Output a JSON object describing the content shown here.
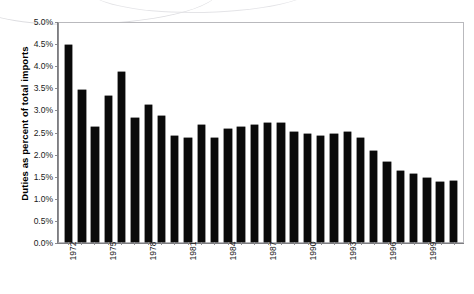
{
  "chart_data": {
    "type": "bar",
    "title": "",
    "xlabel": "",
    "ylabel": "Duties as percent of total imports",
    "ylim": [
      0.0,
      5.0
    ],
    "ytick_labels": [
      "0.0%",
      "0.5%",
      "1.0%",
      "1.5%",
      "2.0%",
      "2.5%",
      "3.0%",
      "3.5%",
      "4.0%",
      "4.5%",
      "5.0%"
    ],
    "ytick_values": [
      0.0,
      0.5,
      1.0,
      1.5,
      2.0,
      2.5,
      3.0,
      3.5,
      4.0,
      4.5,
      5.0
    ],
    "grid": false,
    "legend": false,
    "bar_color": "#0a0a0a",
    "plot_border_color": "#b9b9bd",
    "axis_color": "#7d7d81",
    "categories": [
      "1972",
      "1973",
      "1974",
      "1975",
      "1976",
      "1977",
      "1978",
      "1979",
      "1980",
      "1981",
      "1982",
      "1983",
      "1984",
      "1985",
      "1986",
      "1987",
      "1988",
      "1989",
      "1990",
      "1991",
      "1992",
      "1993",
      "1994",
      "1995",
      "1996",
      "1997",
      "1998",
      "1999",
      "2000",
      "2001"
    ],
    "xtick_labels_shown": [
      "1972",
      "1975",
      "1978",
      "1981",
      "1984",
      "1987",
      "1990",
      "1993",
      "1996",
      "1999"
    ],
    "xtick_label_interval": 3,
    "values": [
      4.45,
      3.45,
      2.6,
      3.3,
      3.85,
      2.8,
      3.1,
      2.85,
      2.4,
      2.35,
      2.65,
      2.35,
      2.55,
      2.6,
      2.65,
      2.7,
      2.7,
      2.5,
      2.45,
      2.4,
      2.45,
      2.5,
      2.35,
      2.05,
      1.8,
      1.6,
      1.55,
      1.45,
      1.35,
      1.38
    ],
    "units": "percent"
  }
}
